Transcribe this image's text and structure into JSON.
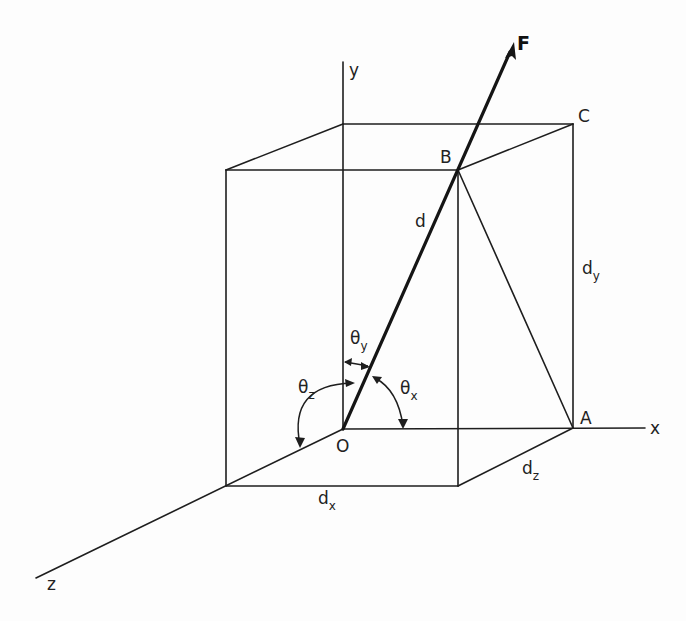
{
  "diagram": {
    "type": "3D force vector direction angles",
    "axes": {
      "x": {
        "label": "x"
      },
      "y": {
        "label": "y"
      },
      "z": {
        "label": "z"
      }
    },
    "origin": {
      "label": "O"
    },
    "points": {
      "A": {
        "label": "A"
      },
      "B": {
        "label": "B"
      },
      "C": {
        "label": "C"
      }
    },
    "force": {
      "label": "F"
    },
    "distances": {
      "d": {
        "label": "d"
      },
      "dx": {
        "base": "d",
        "sub": "x"
      },
      "dy": {
        "base": "d",
        "sub": "y"
      },
      "dz": {
        "base": "d",
        "sub": "z"
      }
    },
    "angles": {
      "theta_x": {
        "base": "θ",
        "sub": "x"
      },
      "theta_y": {
        "base": "θ",
        "sub": "y"
      },
      "theta_z": {
        "base": "θ",
        "sub": "z"
      }
    },
    "caption_partial": "..."
  }
}
